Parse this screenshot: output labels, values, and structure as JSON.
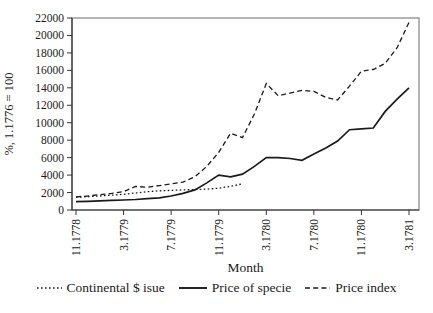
{
  "chart_data": {
    "type": "line",
    "title": "",
    "ylabel": "%, 1.1776 = 100",
    "xlabel": "Month",
    "ylim": [
      0,
      22000
    ],
    "ytick_step": 2000,
    "y_tick_labels": [
      "0",
      "2000",
      "4000",
      "6000",
      "8000",
      "10000",
      "12000",
      "14000",
      "16000",
      "18000",
      "20000",
      "22000"
    ],
    "x_tick_labels": [
      "11.1778",
      "3.1779",
      "7.1779",
      "11.1779",
      "3.1780",
      "7.1780",
      "11.1780",
      "3.1781"
    ],
    "x_tick_indices": [
      0,
      4,
      8,
      12,
      16,
      20,
      24,
      28
    ],
    "x": [
      "11.1778",
      "12.1778",
      "1.1779",
      "2.1779",
      "3.1779",
      "4.1779",
      "5.1779",
      "6.1779",
      "7.1779",
      "8.1779",
      "9.1779",
      "10.1779",
      "11.1779",
      "12.1779",
      "1.1780",
      "2.1780",
      "3.1780",
      "4.1780",
      "5.1780",
      "6.1780",
      "7.1780",
      "8.1780",
      "9.1780",
      "10.1780",
      "11.1780",
      "12.1780",
      "1.1781",
      "2.1781",
      "3.1781"
    ],
    "series": [
      {
        "id": "continental-issue",
        "name": "Continental $ isue",
        "style": "dotted",
        "values": [
          1450,
          1520,
          1600,
          1700,
          1800,
          1950,
          2100,
          2200,
          2250,
          2300,
          2350,
          2400,
          2500,
          2700,
          3000,
          null,
          null,
          null,
          null,
          null,
          null,
          null,
          null,
          null,
          null,
          null,
          null,
          null,
          null
        ]
      },
      {
        "id": "price-of-specie",
        "name": "Price of specie",
        "style": "solid",
        "values": [
          950,
          1000,
          1050,
          1100,
          1150,
          1200,
          1300,
          1400,
          1600,
          1900,
          2300,
          3100,
          4000,
          3800,
          4100,
          5000,
          6000,
          6000,
          5900,
          5700,
          6400,
          7100,
          7900,
          9200,
          9300,
          9400,
          11300,
          12700,
          14000
        ]
      },
      {
        "id": "price-index",
        "name": "Price index",
        "style": "dashed",
        "values": [
          1500,
          1600,
          1750,
          1900,
          2100,
          2700,
          2600,
          2800,
          3000,
          3200,
          3800,
          5000,
          6600,
          8800,
          8300,
          11000,
          14500,
          13100,
          13400,
          13700,
          13600,
          12900,
          12600,
          14200,
          15900,
          16100,
          16800,
          18600,
          21500
        ]
      }
    ],
    "legend_position": "bottom",
    "grid": false,
    "colors": {
      "line": "#1a1a1a",
      "axis": "#333333",
      "frame": "#9a9a9a",
      "text": "#1a1a1a",
      "background": "#ffffff"
    }
  }
}
